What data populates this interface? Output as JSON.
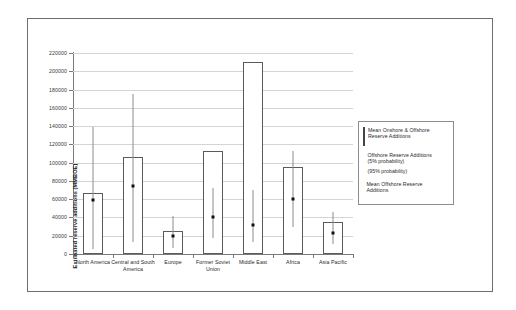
{
  "chart_data": {
    "type": "bar",
    "title": "",
    "subtitle": "",
    "xlabel": "",
    "ylabel": "Estimated reserve additions (MMBOE)",
    "ylim": [
      0,
      220000
    ],
    "ytick_step": 20000,
    "yticks": [
      "220000",
      "200000",
      "180000",
      "160000",
      "140000",
      "120000",
      "100000",
      "80000",
      "60000",
      "40000",
      "20000",
      "0"
    ],
    "grid": true,
    "legend_position": "right",
    "categories": [
      "North America",
      "Central and South America",
      "Europe",
      "Former Soviet Union",
      "Middle East",
      "Africa",
      "Asia Pacific"
    ],
    "series": [
      {
        "name": "Mean Onshore & Offshore Reserve Additions",
        "type": "bar",
        "values": [
          67000,
          106000,
          25000,
          113000,
          210000,
          95000,
          35000
        ]
      },
      {
        "name": "Mean Offshore Reserve Additions",
        "type": "marker",
        "values": [
          62000,
          78000,
          23000,
          44000,
          35000,
          63000,
          26000
        ]
      },
      {
        "name": "Offshore Reserve Additions (5% probability) / (95% probability)",
        "type": "errorbar",
        "low": [
          5000,
          13000,
          7000,
          18000,
          13000,
          30000,
          11000
        ],
        "high": [
          139000,
          175000,
          42000,
          72000,
          70000,
          113000,
          46000
        ]
      }
    ],
    "legend": [
      {
        "id": "mean-onshore-offshore",
        "swatch": "open-square",
        "line1": "Mean Onshore & Offshore",
        "line2": "Reserve Additions"
      },
      {
        "id": "offshore-probability-range",
        "swatch": "vertical-line",
        "line1": "Offshore Reserve Additions",
        "line2": "(5% probability)",
        "line3": "(95% probability)"
      },
      {
        "id": "mean-offshore",
        "swatch": "filled-square",
        "line1": "Mean Offshore Reserve",
        "line2": "Additions"
      }
    ]
  },
  "colors": {
    "frame": "#6e6e6e",
    "axis": "#7a7a7a",
    "gridline": "#d4d4d4",
    "bar_stroke": "#5a5a5a",
    "bar_fill": "#ffffff",
    "errorbar": "#8c8c8c",
    "marker": "#111111",
    "text": "#2a2a2a",
    "background": "#ffffff"
  }
}
